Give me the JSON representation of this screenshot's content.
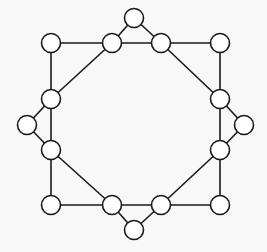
{
  "diagram": {
    "type": "graph",
    "node_radius": 9.5,
    "stroke_color": "#1a1a1a",
    "node_fill": "#ffffff",
    "background": "#f8f8f8",
    "nodes": [
      {
        "id": "top-tip",
        "x": 134,
        "y": 18
      },
      {
        "id": "top-left",
        "x": 112,
        "y": 43
      },
      {
        "id": "top-right",
        "x": 161,
        "y": 43
      },
      {
        "id": "corner-tl",
        "x": 51,
        "y": 43
      },
      {
        "id": "corner-tr",
        "x": 220,
        "y": 43
      },
      {
        "id": "left-top",
        "x": 51,
        "y": 99
      },
      {
        "id": "left-bottom",
        "x": 51,
        "y": 150
      },
      {
        "id": "left-tip",
        "x": 27,
        "y": 125
      },
      {
        "id": "right-top",
        "x": 220,
        "y": 99
      },
      {
        "id": "right-bottom",
        "x": 220,
        "y": 150
      },
      {
        "id": "right-tip",
        "x": 244,
        "y": 125
      },
      {
        "id": "corner-bl",
        "x": 51,
        "y": 205
      },
      {
        "id": "corner-br",
        "x": 220,
        "y": 205
      },
      {
        "id": "bottom-left",
        "x": 112,
        "y": 205
      },
      {
        "id": "bottom-right",
        "x": 161,
        "y": 205
      },
      {
        "id": "bottom-tip",
        "x": 134,
        "y": 230
      }
    ],
    "edges": [
      [
        "top-tip",
        "top-left"
      ],
      [
        "top-tip",
        "top-right"
      ],
      [
        "top-left",
        "top-right"
      ],
      [
        "corner-tl",
        "top-left"
      ],
      [
        "corner-tl",
        "left-top"
      ],
      [
        "top-left",
        "left-top"
      ],
      [
        "top-right",
        "corner-tr"
      ],
      [
        "corner-tr",
        "right-top"
      ],
      [
        "top-right",
        "right-top"
      ],
      [
        "left-top",
        "left-tip"
      ],
      [
        "left-tip",
        "left-bottom"
      ],
      [
        "left-top",
        "left-bottom"
      ],
      [
        "right-top",
        "right-tip"
      ],
      [
        "right-tip",
        "right-bottom"
      ],
      [
        "right-top",
        "right-bottom"
      ],
      [
        "left-bottom",
        "corner-bl"
      ],
      [
        "corner-bl",
        "bottom-left"
      ],
      [
        "left-bottom",
        "bottom-left"
      ],
      [
        "right-bottom",
        "corner-br"
      ],
      [
        "corner-br",
        "bottom-right"
      ],
      [
        "right-bottom",
        "bottom-right"
      ],
      [
        "bottom-left",
        "bottom-right"
      ],
      [
        "bottom-left",
        "bottom-tip"
      ],
      [
        "bottom-tip",
        "bottom-right"
      ]
    ]
  }
}
